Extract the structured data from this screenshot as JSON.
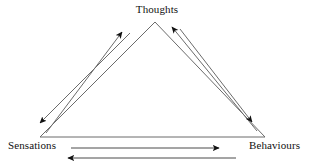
{
  "diagram": {
    "type": "cognitive-triangle",
    "background_color": "#ffffff",
    "line_color": "#4a4a4a",
    "arrow_color": "#111111",
    "text_color": "#111111",
    "nodes": [
      {
        "id": "thoughts",
        "label": "Thoughts",
        "position": "top-center"
      },
      {
        "id": "sensations",
        "label": "Sensations",
        "position": "bottom-left"
      },
      {
        "id": "behaviours",
        "label": "Behaviours",
        "position": "bottom-right"
      }
    ],
    "connections": [
      {
        "id": "sensations-to-thoughts",
        "from": "Sensations",
        "to": "Thoughts",
        "direction": "up-right"
      },
      {
        "id": "thoughts-to-sensations",
        "from": "Thoughts",
        "to": "Sensations",
        "direction": "down-left"
      },
      {
        "id": "behaviours-to-thoughts",
        "from": "Behaviours",
        "to": "Thoughts",
        "direction": "up-left"
      },
      {
        "id": "thoughts-to-behaviours",
        "from": "Thoughts",
        "to": "Behaviours",
        "direction": "down-right"
      },
      {
        "id": "sensations-to-behaviours",
        "from": "Sensations",
        "to": "Behaviours",
        "direction": "right"
      },
      {
        "id": "behaviours-to-sensations",
        "from": "Behaviours",
        "to": "Sensations",
        "direction": "left"
      }
    ]
  }
}
